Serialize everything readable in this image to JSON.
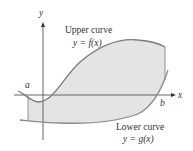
{
  "figure": {
    "axes": {
      "x_label": "x",
      "y_label": "y"
    },
    "bounds": {
      "a_label": "a",
      "b_label": "b"
    },
    "upper_curve": {
      "title": "Upper curve",
      "equation": "y = f(x)"
    },
    "lower_curve": {
      "title": "Lower curve",
      "equation": "y = g(x)"
    },
    "colors": {
      "region_fill": "#e4e4e4",
      "curve": "#7a7a7a",
      "axis": "#555555",
      "text": "#333333"
    }
  }
}
